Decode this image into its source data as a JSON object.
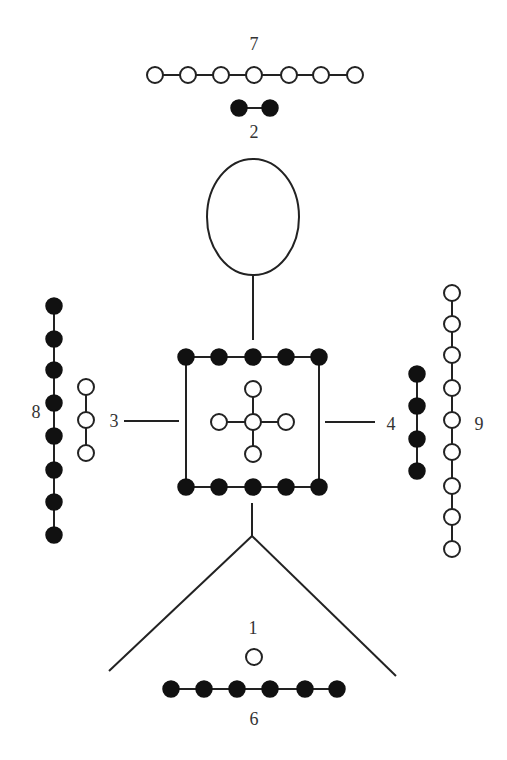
{
  "labels": {
    "top": "7",
    "under_top": "2",
    "left_outer": "8",
    "left_inner": "3",
    "right_inner": "4",
    "right_outer": "9",
    "bottom_upper": "1",
    "bottom_lower": "6"
  },
  "groups": [
    {
      "label": "7",
      "count": 7,
      "color": "white",
      "orientation": "horizontal",
      "position": "top"
    },
    {
      "label": "2",
      "count": 2,
      "color": "black",
      "orientation": "horizontal",
      "position": "below-top"
    },
    {
      "label": "8",
      "count": 8,
      "color": "black",
      "orientation": "vertical",
      "position": "left-outer"
    },
    {
      "label": "3",
      "count": 3,
      "color": "white",
      "orientation": "vertical",
      "position": "left-inner"
    },
    {
      "label": "4",
      "count": 4,
      "color": "black",
      "orientation": "vertical",
      "position": "right-inner"
    },
    {
      "label": "9",
      "count": 9,
      "color": "white",
      "orientation": "vertical",
      "position": "right-outer"
    },
    {
      "label": "5",
      "count": 5,
      "color": "white",
      "orientation": "cross",
      "position": "center"
    },
    {
      "label": "10",
      "count": 10,
      "color": "black",
      "orientation": "square-top-bottom",
      "position": "center-square"
    },
    {
      "label": "1",
      "count": 1,
      "color": "white",
      "orientation": "single",
      "position": "bottom-upper"
    },
    {
      "label": "6",
      "count": 6,
      "color": "black",
      "orientation": "horizontal",
      "position": "bottom"
    }
  ],
  "colors": {
    "black": "#111111",
    "white": "#ffffff",
    "stroke": "#222222"
  }
}
